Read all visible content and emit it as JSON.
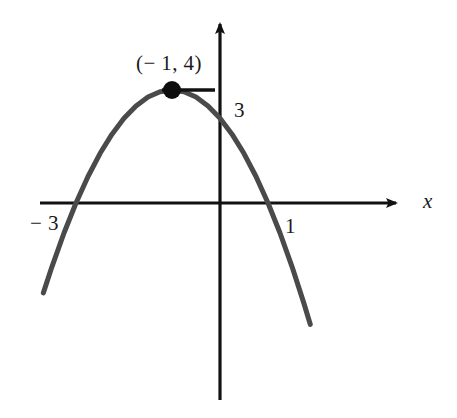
{
  "figure": {
    "background_color": "#ffffff",
    "width": 457,
    "height": 418
  },
  "axes": {
    "x_axis_label": "x",
    "y_axis_label": "",
    "x_axis_color": "#111111",
    "y_axis_color": "#111111",
    "origin_px": {
      "x": 220,
      "y": 203
    },
    "x_axis_span_px": {
      "start": 40,
      "end": 402
    },
    "y_axis_span_px": {
      "start": 18,
      "end": 400
    },
    "arrowheads": [
      "x-positive",
      "y-positive"
    ],
    "ticks_shown": false,
    "grid": false
  },
  "labels": {
    "vertex": "(− 1, 4)",
    "y_intercept": "3",
    "root_left": "− 3",
    "root_right": "1",
    "x_axis": "x"
  },
  "markers": {
    "vertex_point": {
      "label": "(− 1, 4)",
      "x": -1,
      "y": 4,
      "px": {
        "x": 188,
        "y": 90
      },
      "radius_px": 9,
      "color": "#0d0d0d"
    },
    "tangent_segment": {
      "description": "horizontal tangent line at the vertex",
      "px": {
        "x1": 162,
        "y1": 90,
        "x2": 215,
        "y2": 90
      },
      "color": "#111111",
      "width_px": 3
    }
  },
  "chart_data": {
    "type": "line",
    "title": "",
    "subtitle": "",
    "xlabel": "x",
    "ylabel": "",
    "legend": [],
    "legend_position": "none",
    "grid": false,
    "xlim": [
      -4.3,
      2.3
    ],
    "ylim": [
      -1.5,
      5.2
    ],
    "curve_color": "#4a4a4a",
    "curve_width_px": 5,
    "function": "y = -(x + 3)(x - 1)",
    "vertex": {
      "x": -1,
      "y": 4
    },
    "roots": [
      -3,
      1
    ],
    "y_intercept": 3,
    "opens": "down",
    "annotations": [
      {
        "text": "(− 1, 4)",
        "x": -1,
        "y": 4,
        "role": "vertex-label"
      },
      {
        "text": "3",
        "x": 0,
        "y": 3,
        "role": "y-intercept-label"
      },
      {
        "text": "− 3",
        "x": -3,
        "y": 0,
        "role": "root-label"
      },
      {
        "text": "1",
        "x": 1,
        "y": 0,
        "role": "root-label"
      }
    ],
    "series": [
      {
        "name": "parabola",
        "x": [
          -3.68,
          -3.5,
          -3.25,
          -3.0,
          -2.75,
          -2.5,
          -2.25,
          -2.0,
          -1.75,
          -1.5,
          -1.25,
          -1.0,
          -0.75,
          -0.5,
          -0.25,
          0.0,
          0.25,
          0.5,
          0.75,
          1.0,
          1.25,
          1.5,
          1.75,
          1.88
        ],
        "values": [
          -2.53,
          -1.75,
          -0.81,
          0.0,
          0.69,
          1.25,
          1.69,
          2.0,
          2.19,
          2.25,
          2.19,
          2.0,
          3.94,
          3.75,
          3.44,
          3.0,
          2.44,
          1.75,
          0.94,
          0.0,
          -1.06,
          -2.25,
          -3.56,
          -4.3
        ]
      }
    ],
    "curve_points_px": [
      [
        73,
        290
      ],
      [
        80,
        276
      ],
      [
        88,
        261
      ],
      [
        96,
        246
      ],
      [
        104,
        232
      ],
      [
        112,
        219
      ],
      [
        120,
        206
      ],
      [
        128,
        194
      ],
      [
        136,
        183
      ],
      [
        144,
        172
      ],
      [
        152,
        163
      ],
      [
        160,
        154
      ],
      [
        168,
        146
      ],
      [
        176,
        139
      ],
      [
        184,
        133
      ],
      [
        188,
        90
      ],
      [
        196,
        91
      ],
      [
        204,
        95
      ],
      [
        212,
        99
      ],
      [
        220,
        103
      ],
      [
        228,
        110
      ],
      [
        236,
        118
      ],
      [
        244,
        128
      ],
      [
        252,
        139
      ],
      [
        260,
        152
      ],
      [
        268,
        166
      ],
      [
        276,
        182
      ],
      [
        284,
        199
      ],
      [
        290,
        295
      ]
    ]
  }
}
